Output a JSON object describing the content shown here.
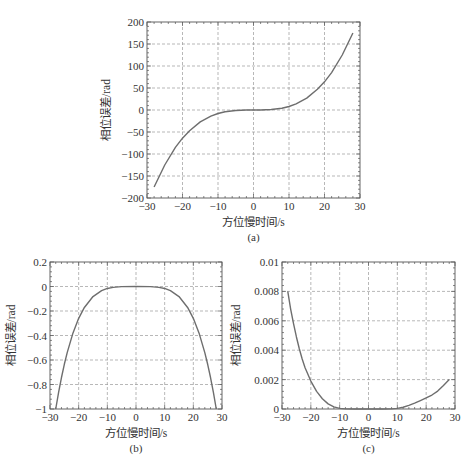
{
  "figure": {
    "captions": [
      "(a)",
      "(b)",
      "(c)"
    ]
  },
  "style": {
    "curve_color": "#6e6e6e",
    "axis_color": "#555555",
    "grid_color": "#9a9a9a"
  },
  "chart_data": [
    {
      "id": "a",
      "type": "line",
      "title": "",
      "caption": "(a)",
      "xlabel": "方位慢时间/s",
      "ylabel": "相位误差/rad",
      "xlim": [
        -30,
        30
      ],
      "ylim": [
        -200,
        200
      ],
      "xticks": [
        -30,
        -20,
        -10,
        0,
        10,
        20,
        30
      ],
      "xtick_labels": [
        "−30",
        "−20",
        "−10",
        "0",
        "10",
        "20",
        "30"
      ],
      "yticks": [
        -200,
        -150,
        -100,
        -50,
        0,
        50,
        100,
        150,
        200
      ],
      "ytick_labels": [
        "−200",
        "−150",
        "−100",
        "−50",
        "0",
        "50",
        "100",
        "150",
        "200"
      ],
      "grid": true,
      "box_px": {
        "left": 147,
        "top": 22,
        "right": 360,
        "bottom": 198
      },
      "series": [
        {
          "name": "phase error",
          "x": [
            -28,
            -25,
            -22,
            -20,
            -18,
            -15,
            -12,
            -10,
            -8,
            -5,
            -2,
            0,
            2,
            5,
            8,
            10,
            12,
            15,
            18,
            20,
            22,
            25,
            28
          ],
          "y": [
            -175,
            -125,
            -85,
            -64,
            -47,
            -27,
            -14,
            -8,
            -4,
            -1,
            -0.1,
            0,
            0.1,
            1,
            4,
            8,
            14,
            27,
            47,
            64,
            85,
            125,
            175
          ]
        }
      ]
    },
    {
      "id": "b",
      "type": "line",
      "title": "",
      "caption": "(b)",
      "xlabel": "方位慢时间/s",
      "ylabel": "相位误差/rad",
      "xlim": [
        -30,
        30
      ],
      "ylim": [
        -1,
        0.2
      ],
      "xticks": [
        -30,
        -20,
        -10,
        0,
        10,
        20,
        30
      ],
      "xtick_labels": [
        "−30",
        "−20",
        "−10",
        "0",
        "10",
        "20",
        "30"
      ],
      "yticks": [
        -1,
        -0.8,
        -0.6,
        -0.4,
        -0.2,
        0,
        0.2
      ],
      "ytick_labels": [
        "−1",
        "−0.8",
        "−0.6",
        "−0.4",
        "−0.2",
        "0",
        "0.2"
      ],
      "grid": true,
      "box_px": {
        "left": 50,
        "top": 262,
        "right": 222,
        "bottom": 409
      },
      "series": [
        {
          "name": "phase error",
          "x": [
            -28,
            -27,
            -26,
            -25,
            -24,
            -22,
            -20,
            -18,
            -15,
            -12,
            -10,
            -8,
            -5,
            0,
            5,
            8,
            10,
            12,
            15,
            18,
            20,
            22,
            24,
            25,
            26,
            27,
            28
          ],
          "y": [
            -1,
            -0.865,
            -0.743,
            -0.635,
            -0.54,
            -0.381,
            -0.26,
            -0.171,
            -0.082,
            -0.034,
            -0.016,
            -0.007,
            -0.001,
            0,
            -0.001,
            -0.007,
            -0.016,
            -0.034,
            -0.082,
            -0.171,
            -0.26,
            -0.381,
            -0.54,
            -0.635,
            -0.743,
            -0.865,
            -1
          ]
        }
      ]
    },
    {
      "id": "c",
      "type": "line",
      "title": "",
      "caption": "(c)",
      "xlabel": "方位慢时间/s",
      "ylabel": "相位误差/rad",
      "xlim": [
        -30,
        30
      ],
      "ylim": [
        0,
        0.01
      ],
      "xticks": [
        -30,
        -20,
        -10,
        0,
        10,
        20,
        30
      ],
      "xtick_labels": [
        "−30",
        "−20",
        "−10",
        "0",
        "10",
        "20",
        "30"
      ],
      "yticks": [
        0,
        0.002,
        0.004,
        0.006,
        0.008,
        0.01
      ],
      "ytick_labels": [
        "0",
        "0.002",
        "0.004",
        "0.006",
        "0.008",
        "0.01"
      ],
      "grid": true,
      "box_px": {
        "left": 282,
        "top": 262,
        "right": 455,
        "bottom": 409
      },
      "series": [
        {
          "name": "phase error",
          "x": [
            -28,
            -27,
            -26,
            -25,
            -24,
            -23,
            -22,
            -20,
            -18,
            -16,
            -14,
            -12,
            -10,
            -8,
            -5,
            0,
            5,
            8,
            10,
            12,
            14,
            16,
            18,
            20,
            22,
            24,
            26,
            28
          ],
          "y": [
            0.008,
            0.0068,
            0.0058,
            0.0049,
            0.0041,
            0.0034,
            0.0028,
            0.0019,
            0.0012,
            0.0007,
            0.00035,
            0.00015,
            4e-05,
            1e-05,
            0,
            0,
            0,
            1e-05,
            4e-05,
            0.00012,
            0.00025,
            0.0004,
            0.00057,
            0.00075,
            0.00095,
            0.00122,
            0.0016,
            0.002
          ]
        }
      ]
    }
  ]
}
